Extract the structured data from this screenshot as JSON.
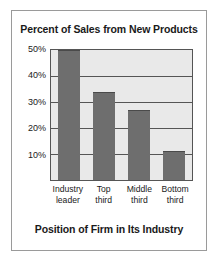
{
  "chart_data": {
    "type": "bar",
    "title": "Percent of Sales from New Products",
    "xlabel": "Position of Firm in Its Industry",
    "ylabel": "",
    "categories": [
      "Industry leader",
      "Top third",
      "Middle third",
      "Bottom third"
    ],
    "category_lines": [
      {
        "line1": "Industry",
        "line2": "leader"
      },
      {
        "line1": "Top",
        "line2": "third"
      },
      {
        "line1": "Middle",
        "line2": "third"
      },
      {
        "line1": "Bottom",
        "line2": "third"
      }
    ],
    "values": [
      50,
      34,
      27,
      11
    ],
    "value_labels": [
      "50%",
      "34%",
      "27%",
      "11%"
    ],
    "ylim": [
      0,
      50
    ],
    "yticks": [
      10,
      20,
      30,
      40,
      50
    ],
    "ytick_labels": [
      "10%",
      "20%",
      "30%",
      "40%",
      "50%"
    ],
    "grid": true,
    "legend": false,
    "colors": {
      "bar_fill": "#6e6e6e",
      "bar_edge": "#4a4a4a",
      "plot_background": "#e9e9e9",
      "axis_line": "#555555",
      "frame_border": "#9a9a9a",
      "text": "#1a1a1a",
      "figure_background": "#ffffff"
    }
  }
}
